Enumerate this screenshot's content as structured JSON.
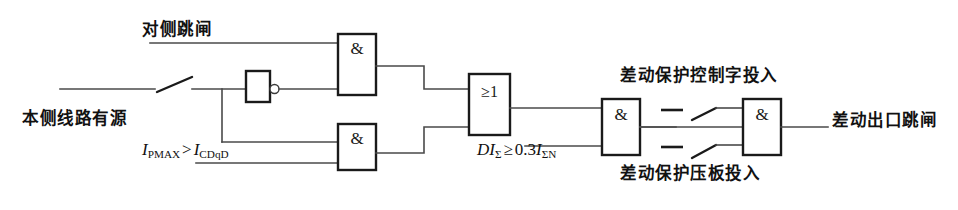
{
  "diagram": {
    "type": "logic-diagram",
    "background_color": "#ffffff",
    "line_color": "#4a4a4a",
    "gate_color": "#1a1a1a",
    "labels": {
      "opposite_trip": "对侧跳闸",
      "local_line_energized": "本侧线路有源",
      "diff_control_word_in": "差动保护控制字投入",
      "diff_plate_in": "差动保护压板投入",
      "diff_output_trip": "差动出口跳闸"
    },
    "formulas": {
      "current_compare": {
        "lhs_symbol": "I",
        "lhs_sub": "PMAX",
        "operator": ">",
        "rhs_symbol": "I",
        "rhs_sub": "CDqD",
        "plain": "I PMAX > I CDqD"
      },
      "diff_threshold": {
        "lhs_prefix": "DI",
        "lhs_sub": "Σ",
        "operator": "≥",
        "coefficient": "0.3",
        "rhs_symbol": "I",
        "rhs_sub": "ΣN",
        "plain": "DI Σ ≥ 0.3 I ΣN"
      }
    },
    "gates": [
      {
        "id": "and-1",
        "symbol": "&",
        "name": "and-gate-1",
        "inputs": 2,
        "x": 338,
        "y": 34,
        "w": 38,
        "h": 61
      },
      {
        "id": "and-2",
        "symbol": "&",
        "name": "and-gate-2",
        "inputs": 2,
        "x": 338,
        "y": 124,
        "w": 38,
        "h": 46
      },
      {
        "id": "or-1",
        "symbol": "≥1",
        "name": "or-gate-1",
        "inputs": 2,
        "x": 469,
        "y": 74,
        "w": 41,
        "h": 61
      },
      {
        "id": "and-3",
        "symbol": "&",
        "name": "and-gate-3",
        "inputs": 2,
        "x": 602,
        "y": 99,
        "w": 38,
        "h": 56
      },
      {
        "id": "and-4",
        "symbol": "&",
        "name": "and-gate-4",
        "inputs": 2,
        "x": 743,
        "y": 99,
        "w": 38,
        "h": 56
      }
    ],
    "inverter": {
      "id": "not-1",
      "name": "not-gate-1",
      "x": 246,
      "y": 65,
      "w": 24,
      "h": 32,
      "bubble_r": 4.5
    },
    "switches": [
      {
        "id": "sw-main",
        "name": "open-contact-main",
        "x": 155,
        "y": 89
      },
      {
        "id": "sw-upper",
        "name": "open-contact-ctrl-word",
        "x": 676,
        "y": 110
      },
      {
        "id": "sw-lower",
        "name": "open-contact-plate",
        "x": 676,
        "y": 147
      }
    ]
  }
}
